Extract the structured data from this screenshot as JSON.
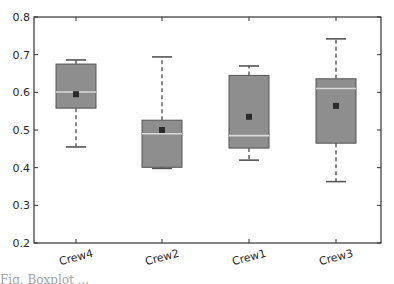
{
  "chart_data": {
    "type": "box",
    "title": "",
    "xlabel": "",
    "ylabel": "",
    "ylim": [
      0.2,
      0.8
    ],
    "yticks": [
      "0.2",
      "0.3",
      "0.4",
      "0.5",
      "0.6",
      "0.7",
      "0.8"
    ],
    "categories": [
      "Crew4",
      "Crew2",
      "Crew1",
      "Crew3"
    ],
    "series": [
      {
        "name": "Crew4",
        "whisker_low": 0.455,
        "q1": 0.558,
        "median": 0.601,
        "mean": 0.595,
        "q3": 0.675,
        "whisker_high": 0.686
      },
      {
        "name": "Crew2",
        "whisker_low": 0.398,
        "q1": 0.401,
        "median": 0.49,
        "mean": 0.5,
        "q3": 0.526,
        "whisker_high": 0.694
      },
      {
        "name": "Crew1",
        "whisker_low": 0.42,
        "q1": 0.452,
        "median": 0.485,
        "mean": 0.535,
        "q3": 0.645,
        "whisker_high": 0.67
      },
      {
        "name": "Crew3",
        "whisker_low": 0.363,
        "q1": 0.465,
        "median": 0.61,
        "mean": 0.564,
        "q3": 0.636,
        "whisker_high": 0.742
      }
    ],
    "grid": false,
    "legend": null,
    "colors": {
      "box_fill": "#8e8e8e",
      "box_edge": "#555555",
      "median": "#d8d8d8",
      "mean_marker": "#2b2b2b",
      "whisker": "#555555",
      "axis": "#333333"
    }
  },
  "caption": {
    "text_fragment": "Fig. Boxplot ..."
  }
}
